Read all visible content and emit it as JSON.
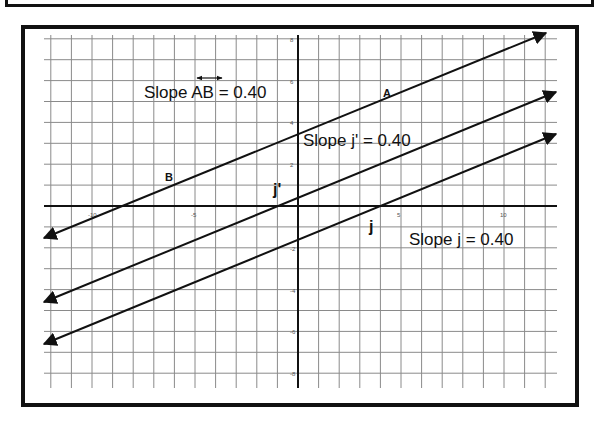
{
  "diagram": {
    "type": "coordinate-plane-parallel-lines",
    "annotations": {
      "slope_ab": "Slope AB = 0.40",
      "slope_ab_overline": "↔",
      "slope_j_prime": "Slope j' = 0.40",
      "slope_j": "Slope j = 0.40"
    },
    "points": {
      "a": "A",
      "b": "B"
    },
    "line_names": {
      "j_prime": "j'",
      "j": "j"
    },
    "x_ticks": [
      "-10",
      "-5",
      "5",
      "10"
    ],
    "y_ticks": [
      "8",
      "6",
      "4",
      "2",
      "-2",
      "-4",
      "-6",
      "-8"
    ],
    "lines": [
      {
        "name": "AB",
        "slope": 0.4,
        "y_intercept": 3.4
      },
      {
        "name": "j'",
        "slope": 0.4,
        "y_intercept": 0.3
      },
      {
        "name": "j",
        "slope": 0.4,
        "y_intercept": -1.5
      }
    ],
    "colors": {
      "line": "#111111",
      "grid": "#8a8a8a",
      "axis": "#111111",
      "frame": "#111111"
    }
  }
}
